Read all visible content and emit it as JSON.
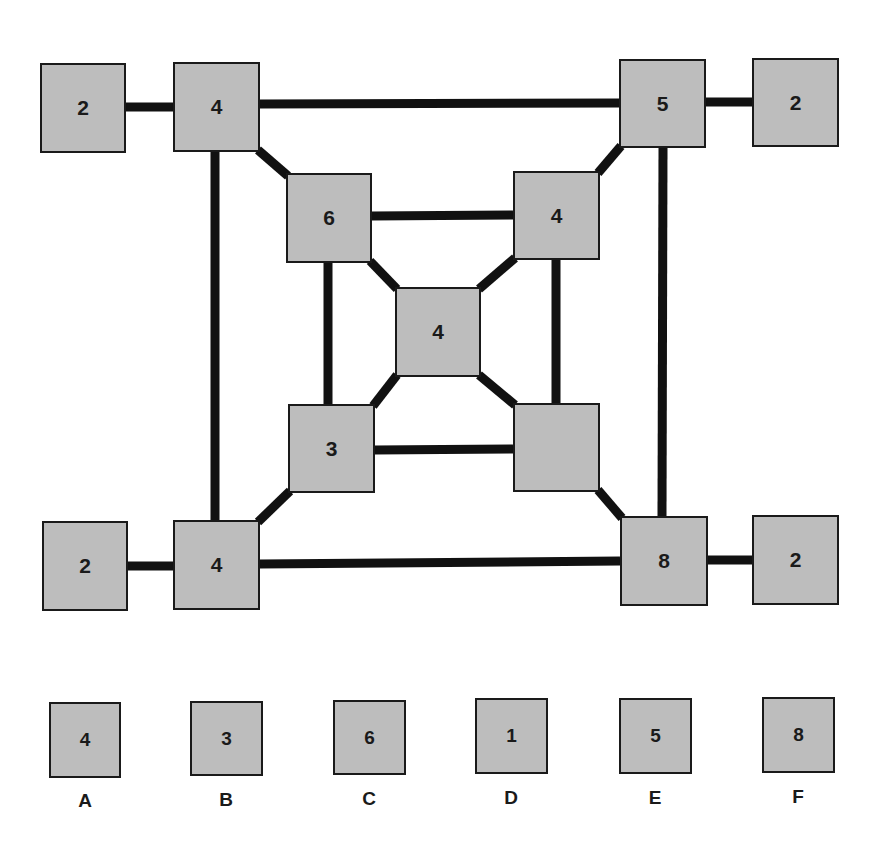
{
  "puzzle": {
    "nodes": [
      {
        "id": "tl-outer",
        "value": "2",
        "x": 40,
        "y": 63,
        "w": 86,
        "h": 90
      },
      {
        "id": "tl",
        "value": "4",
        "x": 173,
        "y": 62,
        "w": 87,
        "h": 90
      },
      {
        "id": "tr",
        "value": "5",
        "x": 619,
        "y": 59,
        "w": 87,
        "h": 89
      },
      {
        "id": "tr-outer",
        "value": "2",
        "x": 752,
        "y": 58,
        "w": 87,
        "h": 89
      },
      {
        "id": "itl",
        "value": "6",
        "x": 286,
        "y": 173,
        "w": 86,
        "h": 90
      },
      {
        "id": "itr",
        "value": "4",
        "x": 513,
        "y": 171,
        "w": 87,
        "h": 89
      },
      {
        "id": "center",
        "value": "4",
        "x": 395,
        "y": 287,
        "w": 86,
        "h": 90
      },
      {
        "id": "ibl",
        "value": "3",
        "x": 288,
        "y": 404,
        "w": 87,
        "h": 89
      },
      {
        "id": "ibr",
        "value": "",
        "x": 513,
        "y": 403,
        "w": 87,
        "h": 89
      },
      {
        "id": "bl-outer",
        "value": "2",
        "x": 42,
        "y": 521,
        "w": 86,
        "h": 90
      },
      {
        "id": "bl",
        "value": "4",
        "x": 173,
        "y": 520,
        "w": 87,
        "h": 90
      },
      {
        "id": "br",
        "value": "8",
        "x": 620,
        "y": 516,
        "w": 88,
        "h": 90
      },
      {
        "id": "br-outer",
        "value": "2",
        "x": 752,
        "y": 515,
        "w": 87,
        "h": 90
      }
    ],
    "edges": [
      [
        "tl-outer",
        "tl"
      ],
      [
        "tl",
        "tr"
      ],
      [
        "tr",
        "tr-outer"
      ],
      [
        "tl",
        "bl"
      ],
      [
        "tr",
        "br"
      ],
      [
        "bl-outer",
        "bl"
      ],
      [
        "bl",
        "br"
      ],
      [
        "br",
        "br-outer"
      ],
      [
        "tl",
        "itl"
      ],
      [
        "tr",
        "itr"
      ],
      [
        "bl",
        "ibl"
      ],
      [
        "br",
        "ibr"
      ],
      [
        "itl",
        "itr"
      ],
      [
        "ibl",
        "ibr"
      ],
      [
        "itl",
        "ibl"
      ],
      [
        "itr",
        "ibr"
      ],
      [
        "itl",
        "center"
      ],
      [
        "itr",
        "center"
      ],
      [
        "ibl",
        "center"
      ],
      [
        "ibr",
        "center"
      ]
    ],
    "missing_node": "ibr"
  },
  "options": [
    {
      "label": "A",
      "value": "4",
      "x": 49,
      "y": 702
    },
    {
      "label": "B",
      "value": "3",
      "x": 190,
      "y": 701
    },
    {
      "label": "C",
      "value": "6",
      "x": 333,
      "y": 700
    },
    {
      "label": "D",
      "value": "1",
      "x": 475,
      "y": 698
    },
    {
      "label": "E",
      "value": "5",
      "x": 619,
      "y": 698
    },
    {
      "label": "F",
      "value": "8",
      "x": 762,
      "y": 697
    }
  ],
  "colors": {
    "box_fill": "#bdbdbd",
    "line": "#111111",
    "text": "#1a1a1a"
  }
}
